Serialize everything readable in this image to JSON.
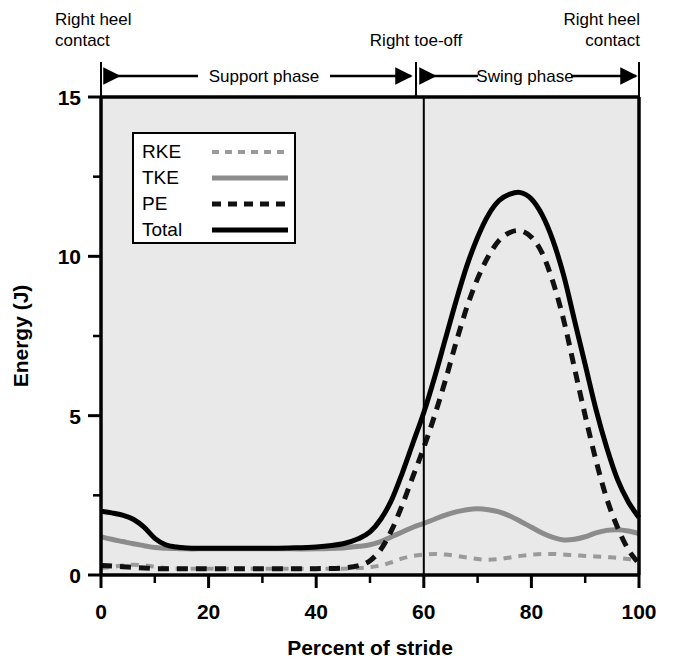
{
  "chart_data": {
    "type": "line",
    "title": "",
    "xlabel": "Percent of stride",
    "ylabel": "Energy (J)",
    "xlim": [
      0,
      100
    ],
    "ylim": [
      0,
      15
    ],
    "xticks": [
      0,
      20,
      40,
      60,
      80,
      100
    ],
    "xticklabels": [
      "0",
      "20",
      "40",
      "60",
      "80",
      "100"
    ],
    "xminorticks": [
      10,
      30,
      50,
      70,
      90
    ],
    "yticks": [
      0,
      5,
      10,
      15
    ],
    "yticklabels": [
      "0",
      "5",
      "10",
      "15"
    ],
    "yminorticks": [
      2.5,
      7.5,
      12.5
    ],
    "grid": false,
    "legend_position": "upper-left-inside",
    "plot_background": "#e9e9e9",
    "x": [
      0,
      2,
      4,
      6,
      8,
      10,
      12,
      14,
      16,
      18,
      20,
      25,
      30,
      35,
      40,
      45,
      48,
      50,
      52,
      54,
      56,
      58,
      60,
      62,
      64,
      66,
      68,
      70,
      72,
      74,
      76,
      78,
      80,
      82,
      84,
      86,
      88,
      90,
      92,
      94,
      96,
      98,
      100
    ],
    "series": [
      {
        "name": "RKE",
        "label": "RKE",
        "style": "dashed",
        "color": "#9a9a9a",
        "linewidth": 4,
        "values": [
          0.22,
          0.25,
          0.3,
          0.32,
          0.3,
          0.26,
          0.22,
          0.2,
          0.2,
          0.2,
          0.2,
          0.2,
          0.2,
          0.2,
          0.2,
          0.2,
          0.22,
          0.25,
          0.3,
          0.4,
          0.52,
          0.6,
          0.64,
          0.66,
          0.64,
          0.6,
          0.55,
          0.5,
          0.48,
          0.5,
          0.55,
          0.6,
          0.64,
          0.66,
          0.66,
          0.64,
          0.62,
          0.6,
          0.58,
          0.56,
          0.54,
          0.5,
          0.45
        ]
      },
      {
        "name": "TKE",
        "label": "TKE",
        "style": "solid",
        "color": "#8c8c8c",
        "linewidth": 5,
        "values": [
          1.2,
          1.12,
          1.05,
          0.98,
          0.92,
          0.86,
          0.84,
          0.83,
          0.82,
          0.82,
          0.82,
          0.82,
          0.82,
          0.82,
          0.82,
          0.85,
          0.9,
          0.95,
          1.05,
          1.2,
          1.35,
          1.5,
          1.62,
          1.75,
          1.88,
          1.98,
          2.05,
          2.08,
          2.05,
          1.98,
          1.85,
          1.68,
          1.5,
          1.32,
          1.18,
          1.1,
          1.12,
          1.2,
          1.32,
          1.4,
          1.42,
          1.38,
          1.3
        ]
      },
      {
        "name": "PE",
        "label": "PE",
        "style": "dashed",
        "color": "#111111",
        "linewidth": 5,
        "values": [
          0.3,
          0.28,
          0.26,
          0.24,
          0.22,
          0.2,
          0.2,
          0.2,
          0.2,
          0.2,
          0.2,
          0.2,
          0.2,
          0.2,
          0.2,
          0.22,
          0.3,
          0.45,
          0.8,
          1.4,
          2.2,
          3.1,
          4.0,
          5.0,
          6.1,
          7.3,
          8.4,
          9.3,
          10.0,
          10.5,
          10.75,
          10.8,
          10.6,
          10.1,
          9.2,
          8.0,
          6.5,
          5.0,
          3.6,
          2.4,
          1.5,
          0.8,
          0.35
        ]
      },
      {
        "name": "Total",
        "label": "Total",
        "style": "solid",
        "color": "#000000",
        "linewidth": 5,
        "values": [
          2.0,
          1.95,
          1.88,
          1.75,
          1.5,
          1.15,
          0.95,
          0.88,
          0.85,
          0.84,
          0.84,
          0.84,
          0.84,
          0.85,
          0.88,
          0.98,
          1.15,
          1.35,
          1.75,
          2.35,
          3.2,
          4.15,
          5.1,
          6.2,
          7.4,
          8.6,
          9.7,
          10.6,
          11.3,
          11.75,
          11.95,
          12.0,
          11.8,
          11.3,
          10.5,
          9.4,
          8.0,
          6.6,
          5.2,
          4.0,
          3.0,
          2.3,
          1.8
        ]
      }
    ],
    "annotations": [
      {
        "name": "left-event",
        "text": "Right heel\ncontact",
        "x": 0
      },
      {
        "name": "toe-off-event",
        "text": "Right toe-off",
        "x": 60
      },
      {
        "name": "right-event",
        "text": "Right heel\ncontact",
        "x": 100
      }
    ],
    "phases": [
      {
        "name": "support-phase",
        "label": "Support phase",
        "start": 0,
        "end": 60
      },
      {
        "name": "swing-phase",
        "label": "Swing phase",
        "start": 60,
        "end": 100
      }
    ],
    "divider_x": 60
  },
  "labels": {
    "event_left_line1": "Right heel",
    "event_left_line2": "contact",
    "event_mid": "Right toe-off",
    "event_right_line1": "Right heel",
    "event_right_line2": "contact",
    "phase_support": "Support phase",
    "phase_swing": "Swing phase",
    "x_axis_title": "Percent of stride",
    "y_axis_title": "Energy (J)",
    "legend": {
      "rke": "RKE",
      "tke": "TKE",
      "pe": "PE",
      "total": "Total"
    },
    "xtick_0": "0",
    "xtick_20": "20",
    "xtick_40": "40",
    "xtick_60": "60",
    "xtick_80": "80",
    "xtick_100": "100",
    "ytick_0": "0",
    "ytick_5": "5",
    "ytick_10": "10",
    "ytick_15": "15"
  }
}
